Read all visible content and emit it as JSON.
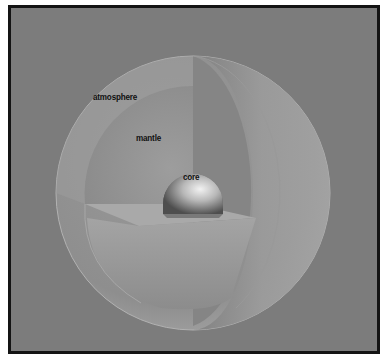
{
  "diagram": {
    "type": "cutaway-sphere",
    "background_color": "#7c7c7c",
    "border_color": "#141414",
    "layers": [
      {
        "id": "atmosphere",
        "label": "atmosphere"
      },
      {
        "id": "mantle",
        "label": "mantle"
      },
      {
        "id": "core",
        "label": "core"
      }
    ]
  }
}
